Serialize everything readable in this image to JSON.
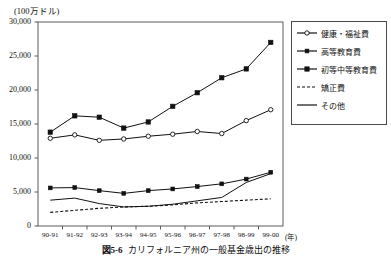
{
  "figure": {
    "caption_number": "図5-6",
    "caption_text": "カリフォルニア州の一般基金歳出の推移",
    "unit_label": "(100万ドル)",
    "xaxis_unit": "(年)"
  },
  "chart_data": {
    "type": "line",
    "title": "カリフォルニア州の一般基金歳出の推移",
    "xlabel": "(年)",
    "ylabel": "(100万ドル)",
    "ylim": [
      0,
      30000
    ],
    "yticks": [
      0,
      5000,
      10000,
      15000,
      20000,
      25000,
      30000
    ],
    "ytick_labels": [
      "0",
      "5,000",
      "10,000",
      "15,000",
      "20,000",
      "25,000",
      "30,000"
    ],
    "grid": false,
    "legend_position": "right",
    "categories": [
      "90-91",
      "91-92",
      "92-93",
      "93-94",
      "94-95",
      "95-96",
      "96-97",
      "97-98",
      "98-99",
      "99-00"
    ],
    "series": [
      {
        "name": "健康・福祉費",
        "marker": "open-circle",
        "line": "solid",
        "values": [
          12900,
          13400,
          12600,
          12800,
          13200,
          13500,
          13900,
          13600,
          15500,
          17100
        ]
      },
      {
        "name": "高等教育費",
        "marker": "filled-square-small",
        "line": "solid",
        "values": [
          5600,
          5650,
          5200,
          4800,
          5200,
          5450,
          5800,
          6200,
          6900,
          7900
        ]
      },
      {
        "name": "初等中等教育費",
        "marker": "filled-square",
        "line": "solid",
        "values": [
          13800,
          16200,
          16000,
          14400,
          15300,
          17600,
          19600,
          21800,
          23100,
          27000
        ]
      },
      {
        "name": "矯正費",
        "marker": "none",
        "line": "dashed",
        "values": [
          2000,
          2300,
          2600,
          2800,
          2900,
          3100,
          3400,
          3600,
          3800,
          4000
        ]
      },
      {
        "name": "その他",
        "marker": "none",
        "line": "solid",
        "values": [
          3800,
          4100,
          3300,
          2800,
          2900,
          3200,
          3700,
          4200,
          6400,
          7700
        ]
      }
    ]
  },
  "legend": {
    "items": [
      {
        "label": "健康・福祉費"
      },
      {
        "label": "高等教育費"
      },
      {
        "label": "初等中等教育費"
      },
      {
        "label": "矯正費"
      },
      {
        "label": "その他"
      }
    ]
  },
  "colors": {
    "line": "#111111",
    "axis": "#4a4a4a",
    "background": "#ffffff"
  }
}
